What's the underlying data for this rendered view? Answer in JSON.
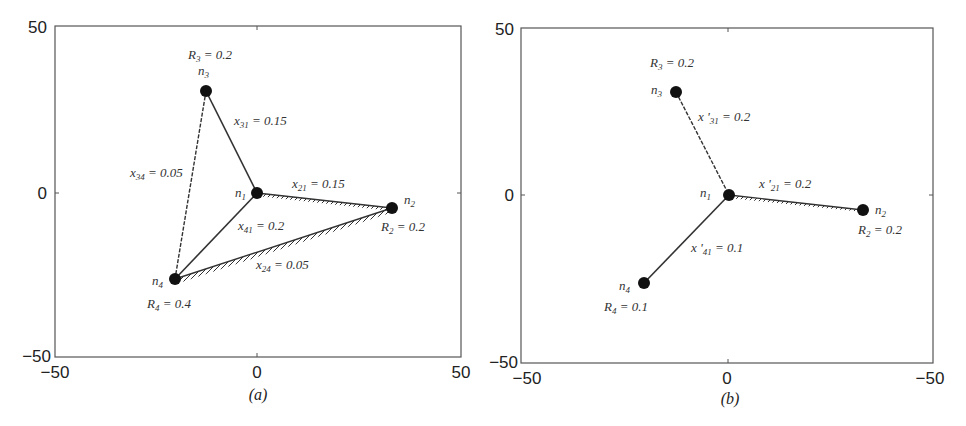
{
  "panels": [
    {
      "id": "a",
      "caption": "(a)",
      "axes": {
        "x_ticks": [
          "−50",
          "0",
          "50"
        ],
        "y_ticks": [
          "50",
          "0",
          "−50"
        ]
      },
      "nodes": [
        {
          "name": "n1",
          "label": "n",
          "sub": "1",
          "x": 0,
          "y": 0
        },
        {
          "name": "n2",
          "label": "n",
          "sub": "2",
          "x": 33,
          "y": -4,
          "R_label": "R",
          "R_sub": "2",
          "R_value": " = 0.2"
        },
        {
          "name": "n3",
          "label": "n",
          "sub": "3",
          "x": -13,
          "y": 31,
          "R_label": "R",
          "R_sub": "3",
          "R_value": " = 0.2"
        },
        {
          "name": "n4",
          "label": "n",
          "sub": "4",
          "x": -20,
          "y": -26,
          "R_label": "R",
          "R_sub": "4",
          "R_value": " = 0.4"
        }
      ],
      "edges": [
        {
          "name": "x31",
          "label": "x",
          "sub": "31",
          "value": " = 0.15"
        },
        {
          "name": "x34",
          "label": "x",
          "sub": "34",
          "value": " = 0.05"
        },
        {
          "name": "x21",
          "label": "x",
          "sub": "21",
          "value": " = 0.15"
        },
        {
          "name": "x41",
          "label": "x",
          "sub": "41",
          "value": " = 0.2"
        },
        {
          "name": "x24",
          "label": "x",
          "sub": "24",
          "value": " = 0.05"
        }
      ]
    },
    {
      "id": "b",
      "caption": "(b)",
      "axes": {
        "x_ticks": [
          "−50",
          "0",
          "−50"
        ],
        "y_ticks": [
          "50",
          "0",
          "−50"
        ]
      },
      "nodes": [
        {
          "name": "n1",
          "label": "n",
          "sub": "1",
          "x": 0,
          "y": 0
        },
        {
          "name": "n2",
          "label": "n",
          "sub": "2",
          "x": 33,
          "y": -4,
          "R_label": "R",
          "R_sub": "2",
          "R_value": " = 0.2"
        },
        {
          "name": "n3",
          "label": "n",
          "sub": "3",
          "x": -13,
          "y": 31,
          "R_label": "R",
          "R_sub": "3",
          "R_value": " = 0.2"
        },
        {
          "name": "n4",
          "label": "n",
          "sub": "4",
          "x": -20,
          "y": -26,
          "R_label": "R",
          "R_sub": "4",
          "R_value": " = 0.1"
        }
      ],
      "edges": [
        {
          "name": "x'31",
          "label": "x '",
          "sub": "31",
          "value": " = 0.2"
        },
        {
          "name": "x'21",
          "label": "x '",
          "sub": "21",
          "value": " = 0.2"
        },
        {
          "name": "x'41",
          "label": "x '",
          "sub": "41",
          "value": " = 0.1"
        }
      ]
    }
  ]
}
